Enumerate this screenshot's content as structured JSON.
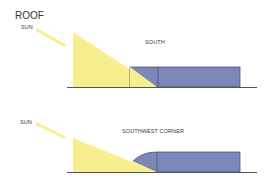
{
  "title": "ROOF",
  "diagrams": [
    {
      "id": "south",
      "label": "SOUTH",
      "sun_label": "SUN",
      "shape": "flat roof edge"
    },
    {
      "id": "southwest",
      "label": "SOUTHWEST CORNER",
      "sun_label": "SUN",
      "shape": "curved roof edge"
    }
  ],
  "colors": {
    "sun_light": "#f7ef8f",
    "roof_fill": "#7d86b8",
    "roof_stroke": "#4b5280",
    "ground": "#555555"
  }
}
